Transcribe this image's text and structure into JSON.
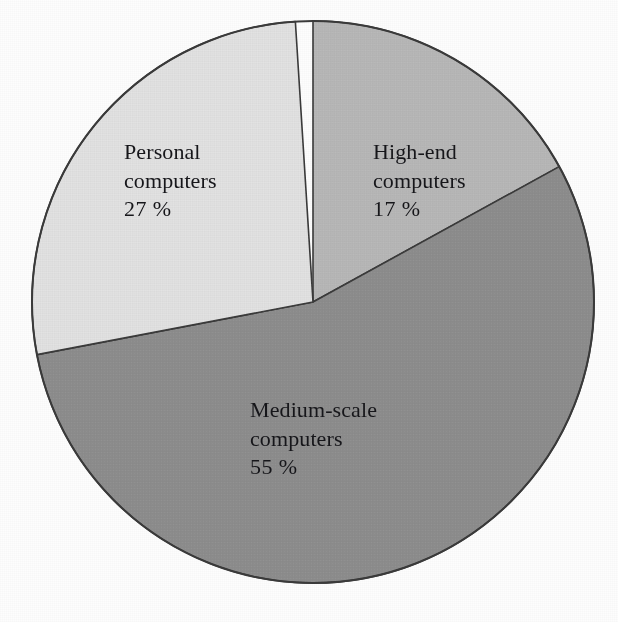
{
  "chart_data": {
    "type": "pie",
    "title": "",
    "subtitle": "",
    "xlabel": "",
    "ylabel": "",
    "legend_position": "none",
    "labels_inside_slices": true,
    "grid": false,
    "units": "%",
    "total": 99,
    "categories": [
      "High-end computers",
      "Medium-scale computers",
      "Personal computers"
    ],
    "values": [
      17,
      55,
      27
    ],
    "start_angle_deg": 0,
    "direction": "clockwise",
    "slices": [
      {
        "name": "High-end computers",
        "label_line1": "High-end",
        "label_line2": "computers",
        "value": 17,
        "value_text": "17 %",
        "color": "#b7b7b7",
        "start_deg": 0,
        "sweep_deg": 61.2
      },
      {
        "name": "Medium-scale computers",
        "label_line1": "Medium-scale",
        "label_line2": "computers",
        "value": 55,
        "value_text": "55 %",
        "color": "#8d8d8d",
        "start_deg": 61.2,
        "sweep_deg": 198.0
      },
      {
        "name": "Personal computers",
        "label_line1": "Personal",
        "label_line2": "computers",
        "value": 27,
        "value_text": "27 %",
        "color": "#e2e2e2",
        "start_deg": 259.2,
        "sweep_deg": 97.2
      }
    ],
    "geometry": {
      "center_x": 313,
      "center_y": 302,
      "radius": 281
    },
    "stroke_color": "#3a3a3a",
    "background_color": "#fdfdfd"
  },
  "caption": {
    "clipped_bottom_text": "·   ·"
  }
}
